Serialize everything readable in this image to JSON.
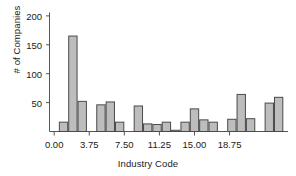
{
  "chart_data": {
    "type": "bar",
    "title": "",
    "xlabel": "Industry Code",
    "ylabel": "# of Companies",
    "categories": [
      0,
      1,
      2,
      3,
      4,
      5,
      6,
      7,
      8,
      9,
      10,
      11,
      12,
      13,
      14,
      15,
      16,
      17,
      18,
      19,
      20,
      21,
      22,
      23,
      24
    ],
    "values": [
      0,
      17,
      166,
      53,
      0,
      47,
      52,
      17,
      0,
      45,
      14,
      13,
      17,
      3,
      17,
      40,
      21,
      17,
      0,
      22,
      65,
      23,
      0,
      50,
      60
    ],
    "xlim": [
      -0.5,
      25.0
    ],
    "ylim": [
      0,
      205
    ],
    "xticks": [
      0,
      3.75,
      7.5,
      11.25,
      15,
      18.75
    ],
    "xtick_labels": [
      "0.00",
      "3.75",
      "7.50",
      "11.25",
      "15.00",
      "18.75"
    ],
    "yticks": [
      50,
      100,
      150,
      200
    ],
    "ytick_labels": [
      "50",
      "100",
      "150",
      "200"
    ],
    "grid": false,
    "legend": null,
    "bar_fill_color": "#bdbdbd",
    "bar_edge_color": "#4a4a4a",
    "axis_color": "#555555",
    "background_color": "#ffffff"
  }
}
